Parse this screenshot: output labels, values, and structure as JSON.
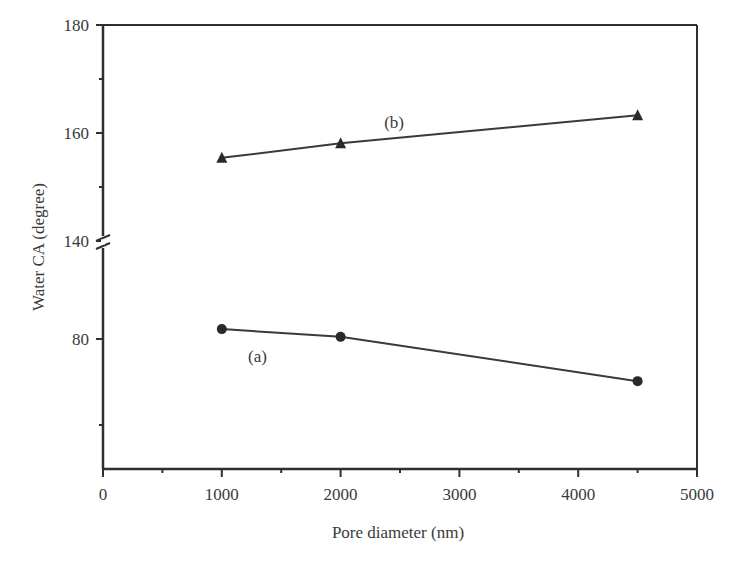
{
  "chart_data": {
    "type": "line",
    "title": "",
    "xlabel": "Pore diameter (nm)",
    "ylabel": "Water CA (degree)",
    "xlim": [
      0,
      5000
    ],
    "x_ticks": [
      0,
      1000,
      2000,
      3000,
      4000,
      5000
    ],
    "x_tick_labels": [
      "0",
      "1000",
      "2000",
      "3000",
      "4000",
      "5000"
    ],
    "y_axis_break": {
      "between": [
        100,
        140
      ],
      "note": "broken y-axis between 80-region and 140-region"
    },
    "y_ticks_upper": [
      140,
      160,
      180
    ],
    "y_ticks_lower": [
      80
    ],
    "y_tick_labels": [
      "180",
      "160",
      "140",
      "80"
    ],
    "ylim_upper_segment": [
      140,
      180
    ],
    "ylim_lower_segment": [
      50,
      100
    ],
    "grid": false,
    "legend": "none (inline labels)",
    "series": [
      {
        "name": "(a)",
        "marker": "circle",
        "x": [
          1000,
          2000,
          4500
        ],
        "values": [
          82.3,
          80.5,
          70.2
        ]
      },
      {
        "name": "(b)",
        "marker": "triangle",
        "x": [
          1000,
          2000,
          4500
        ],
        "values": [
          155.4,
          158.1,
          163.3
        ]
      }
    ],
    "annotations": [
      {
        "text": "(a)",
        "near_series": "(a)",
        "x": 1300,
        "y": 76
      },
      {
        "text": "(b)",
        "near_series": "(b)",
        "x": 2450,
        "y": 162
      }
    ]
  },
  "colors": {
    "axis": "#2f2f2f",
    "line": "#3a3a3a",
    "marker": "#2a2a2a",
    "background": "#ffffff"
  }
}
